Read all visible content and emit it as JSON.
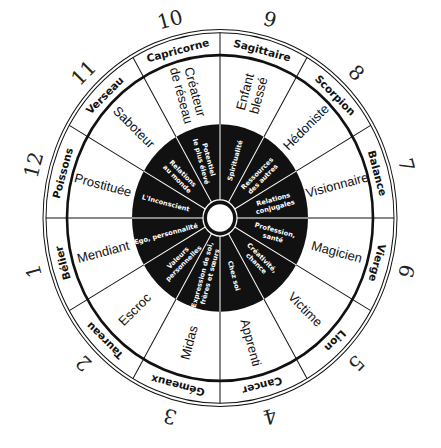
{
  "wheel": {
    "house_numbers": [
      "1",
      "2",
      "3",
      "4",
      "5",
      "6",
      "7",
      "8",
      "9",
      "10",
      "11",
      "12"
    ],
    "signs": [
      "Bélier",
      "Taureau",
      "Gémeaux",
      "Cancer",
      "Lion",
      "Vierge",
      "Balance",
      "Scorpion",
      "Sagittaire",
      "Capricorne",
      "Verseau",
      "Poissons"
    ],
    "archetypes": [
      [
        "Mendiant"
      ],
      [
        "Escroc"
      ],
      [
        "Midas"
      ],
      [
        "Apprenti"
      ],
      [
        "Victime"
      ],
      [
        "Magicien"
      ],
      [
        "Visionnaire"
      ],
      [
        "Hédoniste"
      ],
      [
        "Enfant",
        "blessé"
      ],
      [
        "Créateur",
        "de réseau"
      ],
      [
        "Saboteur"
      ],
      [
        "Prostituée"
      ]
    ],
    "houses": [
      [
        "Ego, personnalité"
      ],
      [
        "Valeurs",
        "personnelles"
      ],
      [
        "Expression de soi,",
        "frères et sœurs"
      ],
      [
        "Chez soi"
      ],
      [
        "Créativité,",
        "chance"
      ],
      [
        "Profession,",
        "santé"
      ],
      [
        "Relations",
        "conjugales"
      ],
      [
        "Ressources",
        "des autres"
      ],
      [
        "Spiritualité"
      ],
      [
        "Potentiel",
        "le plus élevé"
      ],
      [
        "Relations",
        "au monde"
      ],
      [
        "L'Inconscient"
      ]
    ],
    "colors": {
      "ink": "#111111",
      "paper": "#ffffff"
    }
  }
}
